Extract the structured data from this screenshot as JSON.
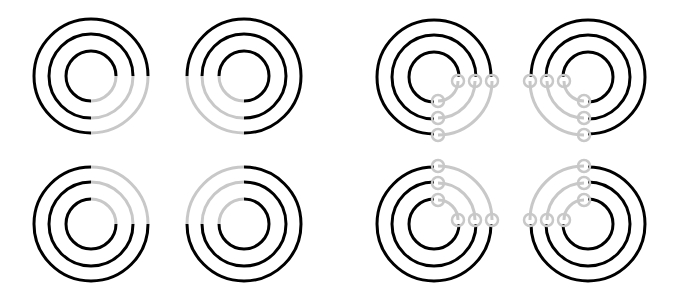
{
  "canvas": {
    "width": 683,
    "height": 304,
    "background": "#ffffff"
  },
  "colors": {
    "black": "#000000",
    "gray": "#c8c8c8"
  },
  "stroke": {
    "arc_width": 3,
    "node_width": 2.5
  },
  "radii": [
    25,
    42,
    57
  ],
  "gray_radii": [
    20,
    37,
    54
  ],
  "node_radius": 6,
  "figures": [
    {
      "id": "fig-1",
      "style": "split",
      "cx": 91,
      "cy": 76,
      "gray_quadrant": "bottom-right"
    },
    {
      "id": "fig-2",
      "style": "split",
      "cx": 244,
      "cy": 76,
      "gray_quadrant": "bottom-left"
    },
    {
      "id": "fig-3",
      "style": "split",
      "cx": 91,
      "cy": 224,
      "gray_quadrant": "top-right"
    },
    {
      "id": "fig-4",
      "style": "split",
      "cx": 244,
      "cy": 224,
      "gray_quadrant": "top-left"
    },
    {
      "id": "fig-5",
      "style": "detached",
      "cx": 434,
      "cy": 77,
      "gray_quadrant": "bottom-right",
      "offset": [
        4,
        4
      ]
    },
    {
      "id": "fig-6",
      "style": "detached",
      "cx": 588,
      "cy": 77,
      "gray_quadrant": "bottom-left",
      "offset": [
        -4,
        4
      ]
    },
    {
      "id": "fig-7",
      "style": "detached",
      "cx": 434,
      "cy": 224,
      "gray_quadrant": "top-right",
      "offset": [
        4,
        -4
      ]
    },
    {
      "id": "fig-8",
      "style": "detached",
      "cx": 588,
      "cy": 224,
      "gray_quadrant": "top-left",
      "offset": [
        -4,
        -4
      ]
    }
  ]
}
